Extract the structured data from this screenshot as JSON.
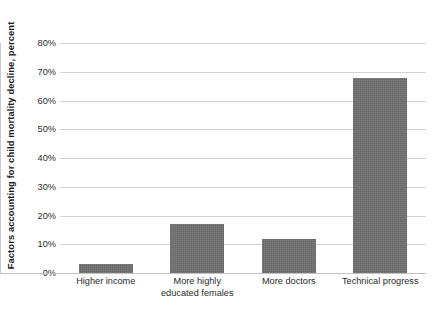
{
  "chart_data": {
    "type": "bar",
    "title": "",
    "subtitle": "",
    "xlabel": "",
    "ylabel": "Factors accounting for child mortality decline, percent",
    "categories": [
      "Higher income",
      "More highly\neducated females",
      "More doctors",
      "Technical progress"
    ],
    "category_lines": [
      [
        "Higher income"
      ],
      [
        "More highly",
        "educated females"
      ],
      [
        "More doctors"
      ],
      [
        "Technical progress"
      ]
    ],
    "values": [
      3,
      17,
      12,
      68
    ],
    "ylim": [
      0,
      80
    ],
    "ytick_values": [
      0,
      10,
      20,
      30,
      40,
      50,
      60,
      70,
      80
    ],
    "ytick_labels": [
      "0%",
      "10%",
      "20%",
      "30%",
      "40%",
      "50%",
      "60%",
      "70%",
      "80%"
    ],
    "grid": true,
    "legend": null,
    "bar_color": "#6f6f6f",
    "gridline_color": "#d2d2d2",
    "axis_color": "#c2c2c2",
    "background_color": "#ffffff"
  }
}
